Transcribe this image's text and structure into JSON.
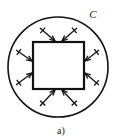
{
  "figure": {
    "caption": "a)",
    "contour_label": "C",
    "colors": {
      "ink": "#121212",
      "background": "#ffffff",
      "label_ink": "#1a1a1a"
    },
    "geometry": {
      "circle": {
        "cx": 58,
        "cy": 67,
        "r": 50
      },
      "square": {
        "x": 33,
        "y": 42,
        "width": 51,
        "height": 47
      },
      "contour_label_pos": {
        "x": 93,
        "y": 18
      },
      "caption_pos": {
        "x": 61,
        "y": 134
      }
    },
    "arrows": {
      "count": 8,
      "direction": "inward",
      "per_side": 2,
      "tick_marks": true,
      "items": [
        {
          "name": "arrow-top-left",
          "x1": 40,
          "y1": 28,
          "x2": 55,
          "y2": 41,
          "tick_t": 0.18
        },
        {
          "name": "arrow-top-right",
          "x1": 77,
          "y1": 28,
          "x2": 62,
          "y2": 41,
          "tick_t": 0.18
        },
        {
          "name": "arrow-right-top",
          "x1": 99,
          "y1": 50,
          "x2": 85,
          "y2": 61,
          "tick_t": 0.18
        },
        {
          "name": "arrow-right-bottom",
          "x1": 99,
          "y1": 85,
          "x2": 85,
          "y2": 73,
          "tick_t": 0.18
        },
        {
          "name": "arrow-bottom-right",
          "x1": 77,
          "y1": 106,
          "x2": 62,
          "y2": 90,
          "tick_t": 0.18
        },
        {
          "name": "arrow-bottom-left",
          "x1": 40,
          "y1": 106,
          "x2": 55,
          "y2": 90,
          "tick_t": 0.18
        },
        {
          "name": "arrow-left-bottom",
          "x1": 16,
          "y1": 85,
          "x2": 32,
          "y2": 73,
          "tick_t": 0.18
        },
        {
          "name": "arrow-left-top",
          "x1": 16,
          "y1": 50,
          "x2": 32,
          "y2": 61,
          "tick_t": 0.18
        }
      ]
    }
  }
}
